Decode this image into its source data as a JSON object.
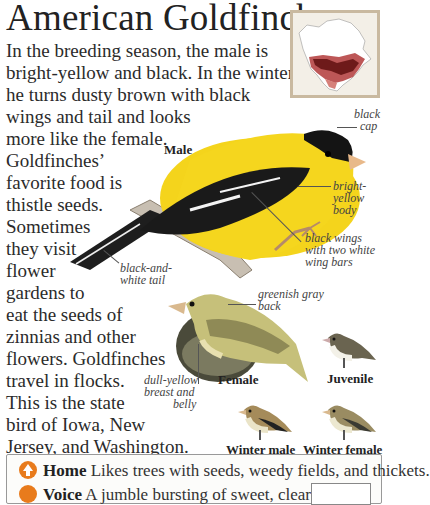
{
  "title": "American Goldfinch",
  "intro_lines": [
    "In the breeding season, the male is",
    "bright-yellow and black. In the winter,",
    "he turns dusty brown with black",
    "wings and tail and looks",
    "more like the female.",
    "Goldfinches’",
    "favorite food is",
    "thistle seeds.",
    "Sometimes",
    "they visit",
    "flower",
    "gardens to",
    "eat the seeds of",
    "zinnias and other",
    "flowers. Goldfinches",
    "travel in flocks.",
    "This is the state",
    "bird of Iowa, New",
    "Jersey, and Washington."
  ],
  "map": {
    "icon": "range-map-north-america",
    "range_color": "#b23a3a",
    "breeding_color": "#7a1f1f"
  },
  "male": {
    "caption": "Male",
    "labels": {
      "cap": [
        "black",
        "cap"
      ],
      "body": [
        "bright-",
        "yellow",
        "body"
      ],
      "wings": [
        "black wings",
        "with two white",
        "wing bars"
      ],
      "tail": [
        "black-and-",
        "white tail"
      ]
    }
  },
  "female": {
    "caption": "Female",
    "labels": {
      "back": [
        "greenish gray",
        "back"
      ],
      "breast": [
        "dull-yellow",
        "breast and",
        "belly"
      ]
    }
  },
  "juvenile": {
    "caption": "Juvenile"
  },
  "winter_male": {
    "caption": "Winter male"
  },
  "winter_female": {
    "caption": "Winter female"
  },
  "info": {
    "home": {
      "heading": "Home",
      "text": " Likes trees with seeds, weedy fields, and thickets.",
      "icon": "home-icon"
    },
    "voice": {
      "heading": "Voice",
      "text": " A jumble bursting of sweet, clear whistles",
      "icon": "voice-icon"
    }
  },
  "colors": {
    "yellow": "#f2d21a",
    "black": "#1c1c1c",
    "female_green": "#b9b56a",
    "accent_orange": "#e87b1c"
  }
}
